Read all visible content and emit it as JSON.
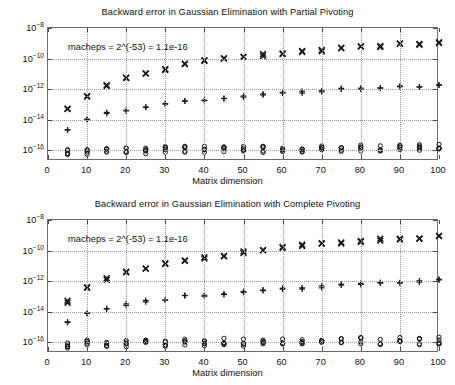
{
  "figure": {
    "background": "#ffffff",
    "axis_color": "#6d6d6d",
    "grid_color": "#9a9a9a",
    "marker_color": "#1a1a1a"
  },
  "chart_data": [
    {
      "type": "scatter",
      "title": "Backward error in Gaussian Elimination with Partial Pivoting",
      "xlabel": "Matrix dimension",
      "ylabel": "",
      "annotation": "macheps = 2^(-53) = 1.1e-16",
      "xlim": [
        0,
        100
      ],
      "ylim": [
        2e-17,
        1e-08
      ],
      "yscale": "log",
      "grid": true,
      "legend": "none",
      "xticks": [
        0,
        10,
        20,
        30,
        40,
        50,
        60,
        70,
        80,
        90,
        100
      ],
      "xticklabels": [
        "0",
        "10",
        "20",
        "30",
        "40",
        "50",
        "60",
        "70",
        "80",
        "90",
        "100"
      ],
      "yticks": [
        1e-08,
        1e-10,
        1e-12,
        1e-14,
        1e-16
      ],
      "yticklabels": [
        "10^-8",
        "10^-10",
        "10^-12",
        "10^-14",
        "10^-16"
      ],
      "x": [
        5,
        10,
        15,
        20,
        25,
        30,
        35,
        40,
        45,
        50,
        55,
        60,
        65,
        70,
        75,
        80,
        85,
        90,
        95,
        100
      ],
      "series": [
        {
          "name": "cross-series",
          "marker": "x",
          "values": [
            4.5e-14,
            3.8e-13,
            1.6e-12,
            5.5e-12,
            1e-11,
            2e-11,
            4.8e-11,
            7e-11,
            1e-10,
            1.3e-10,
            1.7e-10,
            2.2e-10,
            2.8e-10,
            3.5e-10,
            5.5e-10,
            6e-10,
            6.5e-10,
            9e-10,
            9.5e-10,
            1.1e-09
          ]
        },
        {
          "name": "plus-series",
          "marker": "+",
          "values": [
            2.5e-15,
            1e-14,
            2.8e-14,
            4.2e-14,
            7.5e-14,
            1.1e-13,
            1.5e-13,
            1.9e-13,
            2.7e-13,
            3.3e-13,
            4.2e-13,
            5.5e-13,
            6.5e-13,
            7.5e-13,
            1e-12,
            1.1e-12,
            1.2e-12,
            1.4e-12,
            1.6e-12,
            1.8e-12
          ]
        },
        {
          "name": "circle-series",
          "marker": "o",
          "values": [
            8e-17,
            8.5e-17,
            9e-17,
            1e-16,
            1e-16,
            1.1e-16,
            1.1e-16,
            1.1e-16,
            1.1e-16,
            1.1e-16,
            1.2e-16,
            1.2e-16,
            1.2e-16,
            1.3e-16,
            1.4e-16,
            1.4e-16,
            1.4e-16,
            1.5e-16,
            1.6e-16,
            1.6e-16
          ]
        }
      ]
    },
    {
      "type": "scatter",
      "title": "Backward error in Gaussian Elimination with Complete Pivoting",
      "xlabel": "Matrix dimension",
      "ylabel": "",
      "annotation": "macheps = 2^(-53) = 1.1e-16",
      "xlim": [
        0,
        100
      ],
      "ylim": [
        2e-17,
        1e-08
      ],
      "yscale": "log",
      "grid": true,
      "legend": "none",
      "xticks": [
        0,
        10,
        20,
        30,
        40,
        50,
        60,
        70,
        80,
        90,
        100
      ],
      "xticklabels": [
        "0",
        "10",
        "20",
        "30",
        "40",
        "50",
        "60",
        "70",
        "80",
        "90",
        "100"
      ],
      "yticks": [
        1e-08,
        1e-10,
        1e-12,
        1e-14,
        1e-16
      ],
      "yticklabels": [
        "10^-8",
        "10^-10",
        "10^-12",
        "10^-14",
        "10^-16"
      ],
      "x": [
        5,
        10,
        15,
        20,
        25,
        30,
        35,
        40,
        45,
        50,
        55,
        60,
        65,
        70,
        75,
        80,
        85,
        90,
        95,
        100
      ],
      "series": [
        {
          "name": "cross-series",
          "marker": "x",
          "values": [
            4.5e-14,
            3.5e-13,
            1.4e-12,
            3.8e-12,
            7.5e-12,
            1.4e-11,
            2.3e-11,
            3.2e-11,
            4.8e-11,
            8e-11,
            1.1e-10,
            1.5e-10,
            2.1e-10,
            3e-10,
            3.4e-10,
            4.2e-10,
            5.2e-10,
            5.8e-10,
            7e-10,
            8.5e-10
          ]
        },
        {
          "name": "plus-series",
          "marker": "+",
          "values": [
            2.2e-15,
            7.5e-15,
            1.5e-14,
            2.8e-14,
            4.8e-14,
            6.5e-14,
            1e-13,
            1.1e-13,
            1.5e-13,
            2.1e-13,
            2.5e-13,
            3e-13,
            3.5e-13,
            4.2e-13,
            5.5e-13,
            6.5e-13,
            7.5e-13,
            9e-13,
            1e-12,
            1.2e-12
          ]
        },
        {
          "name": "circle-series",
          "marker": "o",
          "values": [
            6e-17,
            1e-16,
            9e-17,
            8.5e-17,
            9.5e-17,
            9e-17,
            1e-16,
            1e-16,
            1.1e-16,
            9.5e-17,
            9e-17,
            1.2e-16,
            1e-16,
            1.1e-16,
            1.2e-16,
            1.2e-16,
            1.1e-16,
            1.3e-16,
            1.1e-16,
            1.3e-16
          ]
        }
      ]
    }
  ]
}
